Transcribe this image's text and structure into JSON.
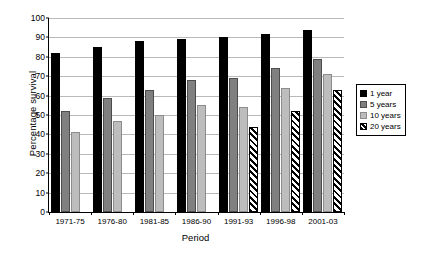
{
  "chart_data": {
    "type": "bar",
    "title": "",
    "xlabel": "Period",
    "ylabel": "Percentage survival",
    "ylim": [
      0,
      100
    ],
    "ytick_step": 10,
    "yticks": [
      0,
      10,
      20,
      30,
      40,
      50,
      60,
      70,
      80,
      90,
      100
    ],
    "grid": true,
    "legend_position": "right",
    "categories": [
      "1971-75",
      "1976-80",
      "1981-85",
      "1986-90",
      "1991-93",
      "1996-98",
      "2001-03"
    ],
    "series": [
      {
        "name": "1 year",
        "key": "s1",
        "color": "#000000",
        "values": [
          82,
          85,
          88,
          89,
          90,
          92,
          94
        ]
      },
      {
        "name": "5 years",
        "key": "s5",
        "color": "#808080",
        "values": [
          52,
          59,
          63,
          68,
          69,
          74,
          79
        ]
      },
      {
        "name": "10 years",
        "key": "s10",
        "color": "#bdbdbd",
        "values": [
          41,
          47,
          50,
          55,
          54,
          64,
          71
        ]
      },
      {
        "name": "20 years",
        "key": "s20",
        "color": "#ffffff-hatched",
        "values": [
          null,
          null,
          null,
          null,
          44,
          52,
          63
        ]
      }
    ]
  },
  "legend": {
    "items": [
      {
        "label": "1 year",
        "swatch": "black-square-swatch"
      },
      {
        "label": "5 years",
        "swatch": "dark-gray-square-swatch"
      },
      {
        "label": "10 years",
        "swatch": "light-gray-square-swatch"
      },
      {
        "label": "20 years",
        "swatch": "hatched-square-swatch"
      }
    ]
  }
}
